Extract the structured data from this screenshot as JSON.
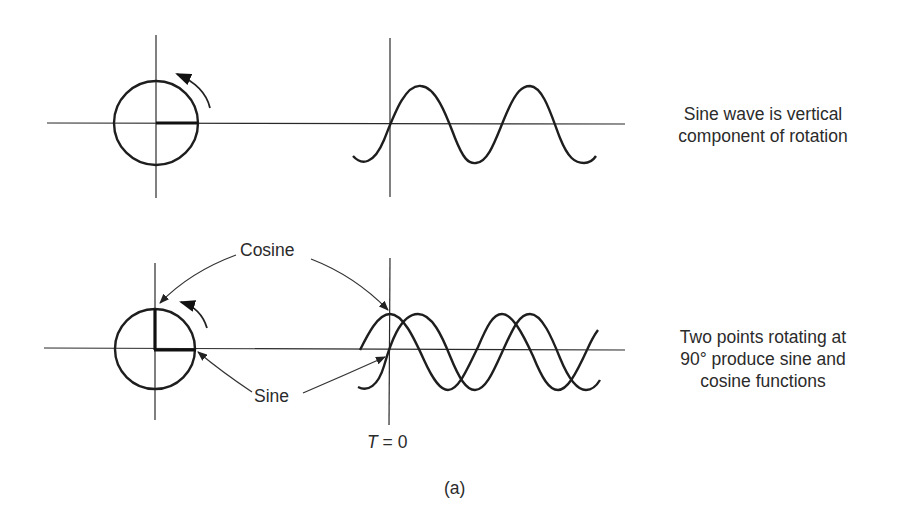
{
  "figure": {
    "caption": "(a)",
    "top_panel": {
      "description_line1": "Sine wave is vertical",
      "description_line2": "component of rotation"
    },
    "bottom_panel": {
      "cosine_label": "Cosine",
      "sine_label": "Sine",
      "time_label_var": "T",
      "time_label_rest": " = 0",
      "description_line1": "Two points rotating at",
      "description_line2": "90° produce sine and",
      "description_line3": "cosine functions"
    }
  },
  "colors": {
    "ink": "#1e1e1e",
    "background": "#ffffff"
  }
}
